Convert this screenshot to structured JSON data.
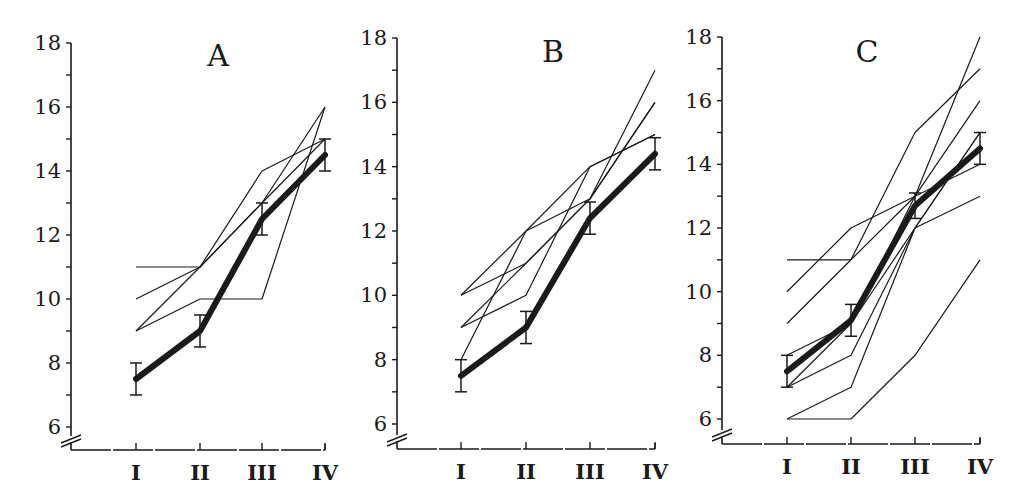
{
  "chart_data": [
    {
      "type": "line",
      "title": "A",
      "categories": [
        "I",
        "II",
        "III",
        "IV"
      ],
      "xlabel": "",
      "ylabel": "",
      "ylim": [
        6,
        18
      ],
      "yticks": [
        6,
        8,
        10,
        12,
        14,
        16,
        18
      ],
      "axis_break": true,
      "grid": false,
      "legend": "none",
      "mean": {
        "name": "mean",
        "values": [
          7.5,
          9.0,
          12.5,
          14.5
        ],
        "error": [
          0.5,
          0.5,
          0.5,
          0.5
        ]
      },
      "series": [
        {
          "name": "individual-1",
          "values": [
            11,
            11,
            14,
            15
          ]
        },
        {
          "name": "individual-2",
          "values": [
            10,
            11,
            13,
            16
          ]
        },
        {
          "name": "individual-3",
          "values": [
            9,
            11,
            13,
            15
          ]
        },
        {
          "name": "individual-4",
          "values": [
            9,
            10,
            10,
            16
          ]
        }
      ]
    },
    {
      "type": "line",
      "title": "B",
      "categories": [
        "I",
        "II",
        "III",
        "IV"
      ],
      "xlabel": "",
      "ylabel": "",
      "ylim": [
        6,
        18
      ],
      "yticks": [
        6,
        8,
        10,
        12,
        14,
        16,
        18
      ],
      "axis_break": true,
      "grid": false,
      "legend": "none",
      "mean": {
        "name": "mean",
        "values": [
          7.5,
          9.0,
          12.4,
          14.4
        ],
        "error": [
          0.5,
          0.5,
          0.5,
          0.5
        ]
      },
      "series": [
        {
          "name": "individual-1",
          "values": [
            10,
            12,
            14,
            15
          ]
        },
        {
          "name": "individual-2",
          "values": [
            10,
            11,
            13,
            17
          ]
        },
        {
          "name": "individual-3",
          "values": [
            9,
            11,
            13,
            16
          ]
        },
        {
          "name": "individual-4",
          "values": [
            9,
            10,
            14,
            15
          ]
        },
        {
          "name": "individual-5",
          "values": [
            8,
            12,
            13,
            16
          ]
        }
      ]
    },
    {
      "type": "line",
      "title": "C",
      "categories": [
        "I",
        "II",
        "III",
        "IV"
      ],
      "xlabel": "",
      "ylabel": "",
      "ylim": [
        6,
        18
      ],
      "yticks": [
        6,
        8,
        10,
        12,
        14,
        16,
        18
      ],
      "axis_break": true,
      "grid": false,
      "legend": "none",
      "mean": {
        "name": "mean",
        "values": [
          7.5,
          9.1,
          12.7,
          14.5
        ],
        "error": [
          0.5,
          0.5,
          0.4,
          0.5
        ]
      },
      "series": [
        {
          "name": "individual-1",
          "values": [
            11,
            11,
            15,
            17
          ]
        },
        {
          "name": "individual-2",
          "values": [
            10,
            12,
            13,
            18
          ]
        },
        {
          "name": "individual-3",
          "values": [
            9,
            11,
            13,
            16
          ]
        },
        {
          "name": "individual-4",
          "values": [
            8,
            9,
            12,
            15
          ]
        },
        {
          "name": "individual-5",
          "values": [
            7,
            9,
            13,
            14
          ]
        },
        {
          "name": "individual-6",
          "values": [
            7,
            8,
            12,
            13
          ]
        },
        {
          "name": "individual-7",
          "values": [
            6,
            7,
            12,
            15
          ]
        },
        {
          "name": "individual-8",
          "values": [
            6,
            6,
            8,
            11
          ]
        }
      ]
    }
  ],
  "panels": [
    {
      "title": "A",
      "x_labels": [
        "I",
        "II",
        "III",
        "IV"
      ],
      "y_labels": [
        "6",
        "8",
        "10",
        "12",
        "14",
        "16",
        "18"
      ]
    },
    {
      "title": "B",
      "x_labels": [
        "I",
        "II",
        "III",
        "IV"
      ],
      "y_labels": [
        "6",
        "8",
        "10",
        "12",
        "14",
        "16",
        "18"
      ]
    },
    {
      "title": "C",
      "x_labels": [
        "I",
        "II",
        "III",
        "IV"
      ],
      "y_labels": [
        "6",
        "8",
        "10",
        "12",
        "14",
        "16",
        "18"
      ]
    }
  ],
  "style": {
    "ink": "#1a1a1a",
    "background": "#ffffff"
  }
}
